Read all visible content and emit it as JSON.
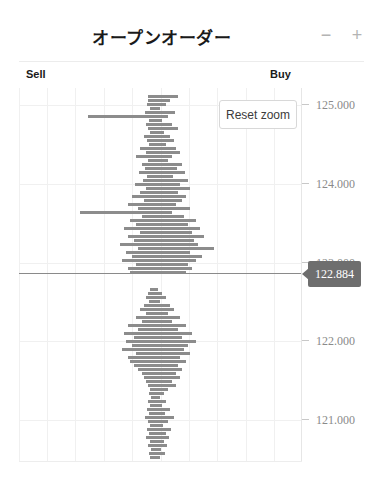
{
  "header": {
    "title": "オープンオーダー",
    "zoom_out_label": "−",
    "zoom_in_label": "+"
  },
  "labels": {
    "sell": "Sell",
    "buy": "Buy"
  },
  "controls": {
    "reset_zoom_label": "Reset zoom"
  },
  "marker": {
    "current_price": "122.884"
  },
  "colors": {
    "bar": "#8c8c8c",
    "grid": "#f0f0f0",
    "marker_bg": "#6e6e6e",
    "axis_text": "#8a8a8a",
    "title_text": "#1a1a1a"
  },
  "chart_data": {
    "type": "bar",
    "orientation": "horizontal",
    "title": "オープンオーダー",
    "xlabel": "",
    "ylabel": "",
    "grid": true,
    "legend_position": "none",
    "axis_ticks": [
      {
        "label": "125.000",
        "value": 125.0,
        "y": 105
      },
      {
        "label": "124.000",
        "value": 124.0,
        "y": 184
      },
      {
        "label": "123.000",
        "value": 123.0,
        "y": 263,
        "hidden_behind_marker": true
      },
      {
        "label": "122.000",
        "value": 122.0,
        "y": 341
      },
      {
        "label": "121.000",
        "value": 121.0,
        "y": 420
      }
    ],
    "ylim": [
      120.47,
      125.27
    ],
    "current_price": 122.884,
    "center_x": 152,
    "plot_left": 19,
    "plot_right": 302,
    "sell_side": "left",
    "buy_side": "right",
    "note": "Horizontal depth histogram; each bar is an order volume at a price level. Positive length extends right (Buy), negative extends left (Sell).",
    "bars": [
      {
        "y": 95,
        "left": 148,
        "right": 178
      },
      {
        "y": 99,
        "left": 148,
        "right": 170
      },
      {
        "y": 103,
        "left": 147,
        "right": 166
      },
      {
        "y": 107,
        "left": 150,
        "right": 160
      },
      {
        "y": 111,
        "left": 145,
        "right": 175
      },
      {
        "y": 115,
        "left": 88,
        "right": 168
      },
      {
        "y": 119,
        "left": 149,
        "right": 162
      },
      {
        "y": 123,
        "left": 146,
        "right": 172
      },
      {
        "y": 127,
        "left": 148,
        "right": 178
      },
      {
        "y": 131,
        "left": 150,
        "right": 164
      },
      {
        "y": 135,
        "left": 144,
        "right": 170
      },
      {
        "y": 139,
        "left": 147,
        "right": 174
      },
      {
        "y": 143,
        "left": 149,
        "right": 166
      },
      {
        "y": 147,
        "left": 140,
        "right": 176
      },
      {
        "y": 151,
        "left": 146,
        "right": 180
      },
      {
        "y": 155,
        "left": 136,
        "right": 172
      },
      {
        "y": 159,
        "left": 148,
        "right": 168
      },
      {
        "y": 163,
        "left": 142,
        "right": 182
      },
      {
        "y": 167,
        "left": 145,
        "right": 177
      },
      {
        "y": 171,
        "left": 139,
        "right": 185
      },
      {
        "y": 175,
        "left": 147,
        "right": 173
      },
      {
        "y": 179,
        "left": 143,
        "right": 188
      },
      {
        "y": 183,
        "left": 135,
        "right": 180
      },
      {
        "y": 187,
        "left": 146,
        "right": 190
      },
      {
        "y": 191,
        "left": 140,
        "right": 178
      },
      {
        "y": 195,
        "left": 132,
        "right": 186
      },
      {
        "y": 199,
        "left": 144,
        "right": 182
      },
      {
        "y": 203,
        "left": 128,
        "right": 176
      },
      {
        "y": 207,
        "left": 138,
        "right": 190
      },
      {
        "y": 211,
        "left": 80,
        "right": 172
      },
      {
        "y": 215,
        "left": 142,
        "right": 184
      },
      {
        "y": 219,
        "left": 130,
        "right": 196
      },
      {
        "y": 223,
        "left": 136,
        "right": 188
      },
      {
        "y": 227,
        "left": 124,
        "right": 200
      },
      {
        "y": 231,
        "left": 140,
        "right": 192
      },
      {
        "y": 235,
        "left": 128,
        "right": 204
      },
      {
        "y": 239,
        "left": 134,
        "right": 194
      },
      {
        "y": 243,
        "left": 120,
        "right": 198
      },
      {
        "y": 247,
        "left": 138,
        "right": 214
      },
      {
        "y": 251,
        "left": 126,
        "right": 190
      },
      {
        "y": 255,
        "left": 132,
        "right": 202
      },
      {
        "y": 259,
        "left": 122,
        "right": 196
      },
      {
        "y": 263,
        "left": 136,
        "right": 188
      },
      {
        "y": 267,
        "left": 128,
        "right": 192
      },
      {
        "y": 271,
        "left": 130,
        "right": 186
      },
      {
        "y": 288,
        "left": 150,
        "right": 158
      },
      {
        "y": 292,
        "left": 148,
        "right": 162
      },
      {
        "y": 296,
        "left": 146,
        "right": 166
      },
      {
        "y": 300,
        "left": 149,
        "right": 160
      },
      {
        "y": 304,
        "left": 144,
        "right": 170
      },
      {
        "y": 308,
        "left": 140,
        "right": 174
      },
      {
        "y": 312,
        "left": 146,
        "right": 168
      },
      {
        "y": 316,
        "left": 136,
        "right": 180
      },
      {
        "y": 320,
        "left": 142,
        "right": 172
      },
      {
        "y": 324,
        "left": 128,
        "right": 186
      },
      {
        "y": 328,
        "left": 138,
        "right": 178
      },
      {
        "y": 332,
        "left": 124,
        "right": 192
      },
      {
        "y": 336,
        "left": 134,
        "right": 182
      },
      {
        "y": 340,
        "left": 126,
        "right": 196
      },
      {
        "y": 344,
        "left": 132,
        "right": 188
      },
      {
        "y": 348,
        "left": 122,
        "right": 184
      },
      {
        "y": 352,
        "left": 136,
        "right": 190
      },
      {
        "y": 356,
        "left": 128,
        "right": 180
      },
      {
        "y": 360,
        "left": 130,
        "right": 186
      },
      {
        "y": 364,
        "left": 134,
        "right": 178
      },
      {
        "y": 368,
        "left": 138,
        "right": 182
      },
      {
        "y": 372,
        "left": 142,
        "right": 176
      },
      {
        "y": 376,
        "left": 144,
        "right": 180
      },
      {
        "y": 380,
        "left": 146,
        "right": 172
      },
      {
        "y": 384,
        "left": 148,
        "right": 176
      },
      {
        "y": 388,
        "left": 150,
        "right": 168
      },
      {
        "y": 392,
        "left": 149,
        "right": 164
      },
      {
        "y": 396,
        "left": 151,
        "right": 160
      },
      {
        "y": 400,
        "left": 148,
        "right": 166
      },
      {
        "y": 404,
        "left": 150,
        "right": 162
      },
      {
        "y": 408,
        "left": 147,
        "right": 170
      },
      {
        "y": 412,
        "left": 149,
        "right": 165
      },
      {
        "y": 416,
        "left": 145,
        "right": 174
      },
      {
        "y": 420,
        "left": 148,
        "right": 168
      },
      {
        "y": 424,
        "left": 150,
        "right": 163
      },
      {
        "y": 428,
        "left": 147,
        "right": 171
      },
      {
        "y": 432,
        "left": 149,
        "right": 166
      },
      {
        "y": 436,
        "left": 146,
        "right": 169
      },
      {
        "y": 440,
        "left": 150,
        "right": 164
      },
      {
        "y": 444,
        "left": 148,
        "right": 167
      },
      {
        "y": 448,
        "left": 151,
        "right": 161
      },
      {
        "y": 452,
        "left": 149,
        "right": 165
      },
      {
        "y": 456,
        "left": 150,
        "right": 160
      }
    ],
    "vertical_gridlines_x": [
      19,
      47,
      75,
      104,
      132,
      161,
      189,
      217,
      246,
      274
    ],
    "horizontal_gridlines_y": [
      105,
      184,
      263,
      341,
      420
    ]
  }
}
